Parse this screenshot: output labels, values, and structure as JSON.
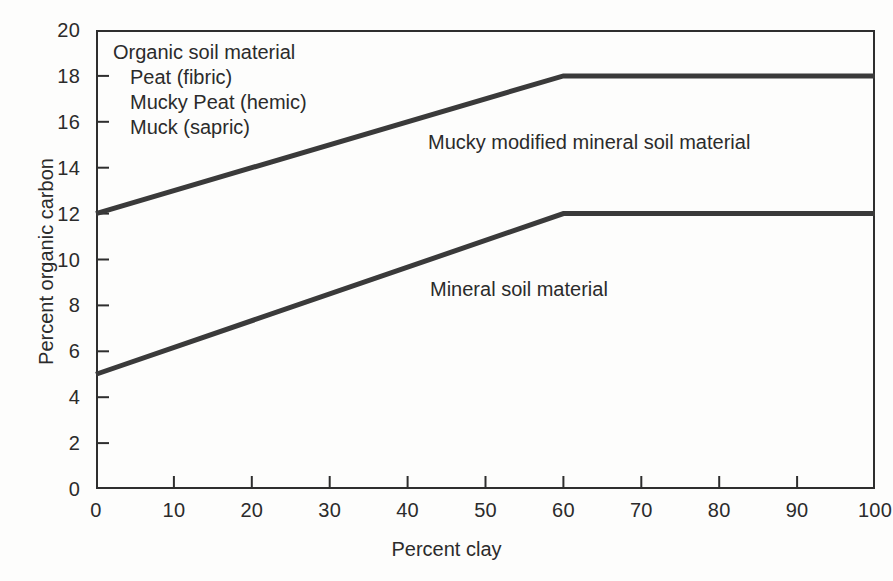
{
  "chart_data": {
    "type": "line",
    "title": "",
    "xlabel": "Percent clay",
    "ylabel": "Percent organic carbon",
    "xlim": [
      0,
      100
    ],
    "ylim": [
      0,
      20
    ],
    "xticks": [
      0,
      10,
      20,
      30,
      40,
      50,
      60,
      70,
      80,
      90,
      100
    ],
    "yticks": [
      0,
      2,
      4,
      6,
      8,
      10,
      12,
      14,
      16,
      18,
      20
    ],
    "grid": false,
    "legend": "inline-labels",
    "line_color": "#3a3a3a",
    "series": [
      {
        "name": "Mucky modified mineral soil material",
        "x": [
          0,
          60,
          100
        ],
        "values": [
          12,
          18,
          18
        ]
      },
      {
        "name": "Mineral soil material",
        "x": [
          0,
          60,
          100
        ],
        "values": [
          5,
          12,
          12
        ]
      }
    ],
    "annotations": [
      {
        "text": "Organic soil material",
        "indent": 0
      },
      {
        "text": "Peat (fibric)",
        "indent": 1
      },
      {
        "text": "Mucky Peat (hemic)",
        "indent": 1
      },
      {
        "text": "Muck (sapric)",
        "indent": 1
      }
    ]
  },
  "axes": {
    "x_title": "Percent clay",
    "y_title": "Percent organic carbon",
    "x_tick_labels": [
      "0",
      "10",
      "20",
      "30",
      "40",
      "50",
      "60",
      "70",
      "80",
      "90",
      "100"
    ],
    "y_tick_labels": [
      "0",
      "2",
      "4",
      "6",
      "8",
      "10",
      "12",
      "14",
      "16",
      "18",
      "20"
    ]
  },
  "annotations": {
    "organic_soil_material": "Organic soil material",
    "peat_fibric": "Peat (fibric)",
    "mucky_peat_hemic": "Mucky Peat (hemic)",
    "muck_sapric": "Muck (sapric)",
    "mucky_modified_mineral": "Mucky modified mineral soil material",
    "mineral_soil_material": "Mineral soil material"
  },
  "colors": {
    "line": "#3a3a3a",
    "axis": "#2e2e2e",
    "text": "#2b2b2b",
    "background": "#fdfdfc"
  }
}
